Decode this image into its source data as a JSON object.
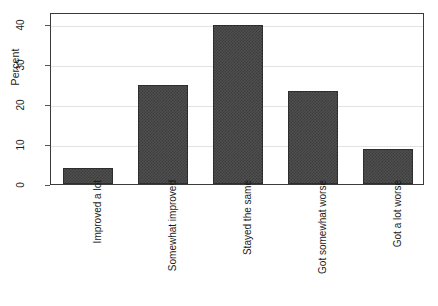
{
  "chart_data": {
    "type": "bar",
    "title": "",
    "subtitle": "",
    "xlabel": "",
    "ylabel": "Percent",
    "categories": [
      "Improved a lot",
      "Somewhat improved",
      "Stayed the same",
      "Got somewhat worse",
      "Got a lot worse"
    ],
    "values": [
      3.9,
      24.7,
      39.7,
      23.3,
      8.8
    ],
    "ylim": [
      0,
      43
    ],
    "yticks": [
      0,
      10,
      20,
      30,
      40
    ],
    "ytick_labels": [
      "0",
      "10",
      "20",
      "30",
      "40"
    ],
    "grid": true,
    "grid_axis": "y",
    "legend": false,
    "legend_position": "none",
    "orientation": "vertical",
    "bar_color": "#4f4f4f",
    "bar_edge_color": "#2e2e2e",
    "grid_color": "#e2e2e2",
    "frame_color": "#3a3a3a",
    "background_color": "#ffffff",
    "xtick_label_rotation": 90,
    "ytick_label_rotation": 90
  }
}
